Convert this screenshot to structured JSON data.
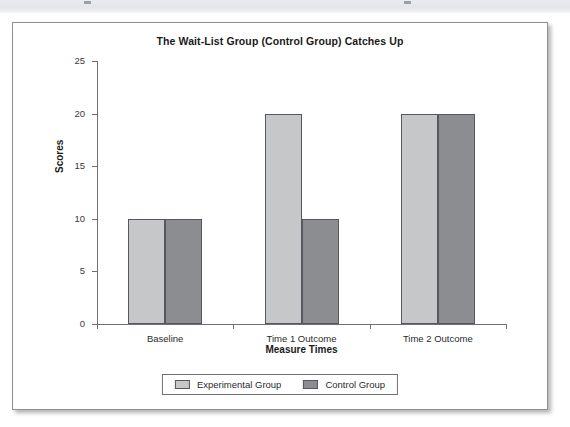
{
  "figure": {
    "background_color": "#ffffff",
    "border_color": "#8e9094"
  },
  "chart_data": {
    "type": "bar",
    "title": "The Wait-List Group (Control Group) Catches Up",
    "xlabel": "Measure Times",
    "ylabel": "Scores",
    "categories": [
      "Baseline",
      "Time 1 Outcome",
      "Time 2 Outcome"
    ],
    "series": [
      {
        "name": "Experimental Group",
        "color": "#c6c7c9",
        "values": [
          10,
          20,
          20
        ]
      },
      {
        "name": "Control Group",
        "color": "#8b8d90",
        "values": [
          10,
          10,
          20
        ]
      }
    ],
    "ylim": [
      0,
      25
    ],
    "yticks": [
      0,
      5,
      10,
      15,
      20,
      25
    ],
    "ytick_labels": [
      "0",
      "5",
      "10",
      "15",
      "20",
      "25"
    ],
    "grid": false,
    "legend_position": "bottom"
  },
  "legend": {
    "items": [
      {
        "label": "Experimental Group",
        "swatch": "experimental"
      },
      {
        "label": "Control Group",
        "swatch": "control"
      }
    ]
  }
}
